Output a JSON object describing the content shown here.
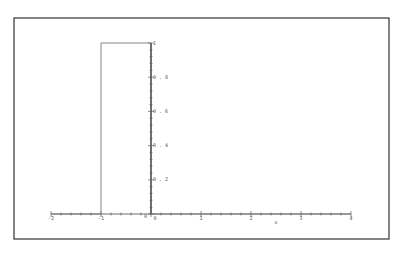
{
  "chart_data": {
    "type": "line",
    "title": "",
    "xlabel": "x",
    "ylabel": "",
    "xlim": [
      -2,
      4
    ],
    "ylim": [
      0,
      1
    ],
    "grid": false,
    "legend": null,
    "x_ticks": [
      "-2",
      "-1",
      "0",
      "1",
      "2",
      "3",
      "4"
    ],
    "y_ticks": [
      "0.2",
      "0.4",
      "0.6",
      "0.8",
      "1"
    ],
    "origin_label": "0",
    "series": [
      {
        "name": "step",
        "x": [
          -2,
          -1,
          -1,
          0,
          0,
          4
        ],
        "y": [
          0,
          0,
          1,
          1,
          0,
          0
        ],
        "color": "#777777"
      }
    ]
  },
  "frame": {
    "border_color": "#333333",
    "axis_color": "#444444",
    "line_color": "#777777"
  }
}
